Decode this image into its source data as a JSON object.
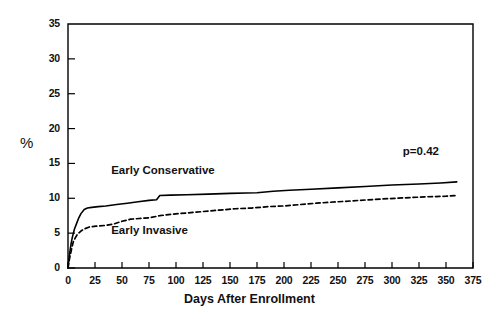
{
  "chart_data": {
    "type": "line",
    "title": "",
    "xlabel": "Days After Enrollment",
    "ylabel": "%",
    "xlim": [
      0,
      375
    ],
    "ylim": [
      0,
      35
    ],
    "xticks": [
      0,
      25,
      50,
      75,
      100,
      125,
      150,
      175,
      200,
      225,
      250,
      275,
      300,
      325,
      350,
      375
    ],
    "yticks": [
      0,
      5,
      10,
      15,
      20,
      25,
      30,
      35
    ],
    "grid": false,
    "legend_position": "inline-annotations",
    "annotations": [
      {
        "text": "p=0.42",
        "x": 310,
        "y": 16.5
      }
    ],
    "series": [
      {
        "name": "Early Conservative",
        "style": "solid",
        "color": "#000000",
        "label_x": 40,
        "label_y": 13.7,
        "points": [
          [
            0,
            0.0
          ],
          [
            1,
            1.5
          ],
          [
            2,
            2.6
          ],
          [
            3,
            3.6
          ],
          [
            4,
            4.4
          ],
          [
            5,
            5.0
          ],
          [
            6,
            5.6
          ],
          [
            8,
            6.4
          ],
          [
            10,
            7.2
          ],
          [
            12,
            7.8
          ],
          [
            15,
            8.4
          ],
          [
            18,
            8.6
          ],
          [
            22,
            8.7
          ],
          [
            28,
            8.8
          ],
          [
            35,
            8.9
          ],
          [
            45,
            9.1
          ],
          [
            55,
            9.3
          ],
          [
            65,
            9.5
          ],
          [
            75,
            9.7
          ],
          [
            82,
            9.8
          ],
          [
            85,
            10.4
          ],
          [
            95,
            10.45
          ],
          [
            110,
            10.5
          ],
          [
            130,
            10.6
          ],
          [
            150,
            10.7
          ],
          [
            165,
            10.75
          ],
          [
            175,
            10.8
          ],
          [
            190,
            11.0
          ],
          [
            205,
            11.15
          ],
          [
            225,
            11.3
          ],
          [
            250,
            11.5
          ],
          [
            275,
            11.7
          ],
          [
            300,
            11.9
          ],
          [
            325,
            12.05
          ],
          [
            345,
            12.2
          ],
          [
            360,
            12.35
          ]
        ]
      },
      {
        "name": "Early Invasive",
        "style": "dashed",
        "color": "#000000",
        "label_x": 40,
        "label_y": 5.2,
        "points": [
          [
            0,
            0.0
          ],
          [
            1,
            1.0
          ],
          [
            2,
            1.8
          ],
          [
            3,
            2.5
          ],
          [
            4,
            3.2
          ],
          [
            5,
            3.8
          ],
          [
            7,
            4.4
          ],
          [
            9,
            4.9
          ],
          [
            12,
            5.3
          ],
          [
            15,
            5.6
          ],
          [
            20,
            5.9
          ],
          [
            26,
            6.0
          ],
          [
            34,
            6.1
          ],
          [
            42,
            6.3
          ],
          [
            50,
            6.7
          ],
          [
            58,
            7.0
          ],
          [
            66,
            7.1
          ],
          [
            75,
            7.2
          ],
          [
            85,
            7.5
          ],
          [
            95,
            7.7
          ],
          [
            110,
            7.9
          ],
          [
            125,
            8.1
          ],
          [
            140,
            8.3
          ],
          [
            155,
            8.5
          ],
          [
            170,
            8.6
          ],
          [
            185,
            8.8
          ],
          [
            200,
            8.9
          ],
          [
            215,
            9.1
          ],
          [
            230,
            9.3
          ],
          [
            250,
            9.5
          ],
          [
            270,
            9.7
          ],
          [
            290,
            9.9
          ],
          [
            310,
            10.05
          ],
          [
            330,
            10.2
          ],
          [
            350,
            10.3
          ],
          [
            360,
            10.4
          ]
        ]
      }
    ]
  },
  "plot": {
    "box_left": 68,
    "box_top": 24,
    "box_right": 473,
    "box_bottom": 268
  }
}
